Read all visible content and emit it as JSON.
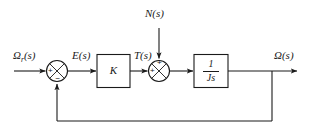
{
  "diagram": {
    "type": "control-system-block-diagram",
    "stroke_color": "#1a1a1a",
    "background_color": "#ffffff",
    "signals": {
      "reference_input": "Ωr(s)",
      "reference_input_base": "Ω",
      "reference_input_sub": "r",
      "reference_input_suffix": "(s)",
      "error": "E(s)",
      "torque": "T(s)",
      "disturbance": "N(s)",
      "output": "Ω(s)"
    },
    "blocks": [
      {
        "name": "gain",
        "label": "K"
      },
      {
        "name": "plant",
        "numerator": "1",
        "denominator": "Js"
      }
    ],
    "summing_junctions": [
      {
        "name": "error-junction",
        "signs": {
          "input_left": "+",
          "input_bottom": "−"
        }
      },
      {
        "name": "disturbance-junction",
        "signs": {
          "input_left": "+",
          "input_top": "+"
        }
      }
    ],
    "feedback": {
      "type": "unity",
      "description": "output fed back to error junction negative input"
    }
  }
}
